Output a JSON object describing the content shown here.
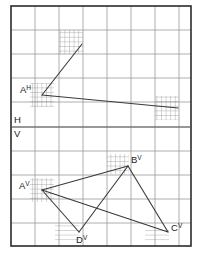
{
  "figure": {
    "width": 201,
    "height": 255,
    "background_color": "#ffffff",
    "border_color": "#2b2b2b",
    "grid_color": "#9a9a9a",
    "fine_grid_color": "#8c8c8c",
    "line_color": "#3a3a3a",
    "label_color": "#1a1a1a"
  },
  "frame": {
    "left": 11,
    "top": 6,
    "right": 191,
    "bottom": 246
  },
  "grid": {
    "major_spacing": 24,
    "fine_spacing": 4.6,
    "x_lines": [
      11,
      35,
      59,
      83,
      107,
      131,
      155,
      179,
      191
    ],
    "y_lines": [
      6,
      30,
      54,
      78,
      102,
      127,
      151,
      175,
      199,
      223,
      246
    ],
    "ground_line_y": 127,
    "show_grid": true
  },
  "plane_labels": [
    {
      "name": "H",
      "text": "H",
      "x": 14,
      "y": 123
    },
    {
      "name": "V",
      "text": "V",
      "x": 14,
      "y": 137
    }
  ],
  "points": [
    {
      "name": "A-horizontal",
      "label": "A",
      "superscript": "H",
      "x": 42,
      "y": 95,
      "label_x": 20,
      "label_y": 93,
      "hatch": "cross"
    },
    {
      "name": "apex-top",
      "label": "",
      "superscript": "",
      "x": 82,
      "y": 44,
      "label_x": 0,
      "label_y": 0,
      "hatch": "cross"
    },
    {
      "name": "right-end-h",
      "label": "",
      "superscript": "",
      "x": 178,
      "y": 108,
      "label_x": 0,
      "label_y": 0,
      "hatch": "cross"
    },
    {
      "name": "A-vertical",
      "label": "A",
      "superscript": "V",
      "x": 42,
      "y": 190,
      "label_x": 19,
      "label_y": 189,
      "hatch": "cross"
    },
    {
      "name": "B-vertical",
      "label": "B",
      "superscript": "V",
      "x": 128,
      "y": 166,
      "label_x": 131,
      "label_y": 163,
      "hatch": "cross"
    },
    {
      "name": "C-vertical",
      "label": "C",
      "superscript": "V",
      "x": 168,
      "y": 232,
      "label_x": 171,
      "label_y": 231,
      "hatch": "horizontal"
    },
    {
      "name": "D-vertical",
      "label": "D",
      "superscript": "V",
      "x": 79,
      "y": 232,
      "label_x": 76,
      "label_y": 243,
      "hatch": "horizontal"
    }
  ],
  "hatch_squares": [
    {
      "name": "hatch-apex-top",
      "x": 59,
      "y": 30,
      "width": 24,
      "height": 24,
      "style": "cross"
    },
    {
      "name": "hatch-a-h",
      "x": 30,
      "y": 83,
      "width": 24,
      "height": 24,
      "style": "cross"
    },
    {
      "name": "hatch-right-end-h",
      "x": 155,
      "y": 96,
      "width": 24,
      "height": 24,
      "style": "cross"
    },
    {
      "name": "hatch-b-v",
      "x": 107,
      "y": 154,
      "width": 22,
      "height": 20,
      "style": "cross"
    },
    {
      "name": "hatch-a-v",
      "x": 30,
      "y": 178,
      "width": 24,
      "height": 24,
      "style": "cross"
    },
    {
      "name": "hatch-d-v",
      "x": 55,
      "y": 223,
      "width": 24,
      "height": 17,
      "style": "horizontal"
    },
    {
      "name": "hatch-c-v",
      "x": 145,
      "y": 228,
      "width": 24,
      "height": 14,
      "style": "horizontal"
    }
  ],
  "segments": [
    {
      "name": "segment-ah-to-apex",
      "x1": 42,
      "y1": 95,
      "x2": 82,
      "y2": 44
    },
    {
      "name": "segment-ah-to-right",
      "x1": 42,
      "y1": 95,
      "x2": 178,
      "y2": 108
    },
    {
      "name": "segment-av-to-bv",
      "x1": 42,
      "y1": 190,
      "x2": 128,
      "y2": 166
    },
    {
      "name": "segment-av-to-dv",
      "x1": 42,
      "y1": 190,
      "x2": 79,
      "y2": 232
    },
    {
      "name": "segment-av-to-cv",
      "x1": 42,
      "y1": 190,
      "x2": 168,
      "y2": 232
    },
    {
      "name": "segment-bv-to-dv",
      "x1": 128,
      "y1": 166,
      "x2": 79,
      "y2": 232
    },
    {
      "name": "segment-bv-to-cv",
      "x1": 128,
      "y1": 166,
      "x2": 168,
      "y2": 232
    }
  ]
}
